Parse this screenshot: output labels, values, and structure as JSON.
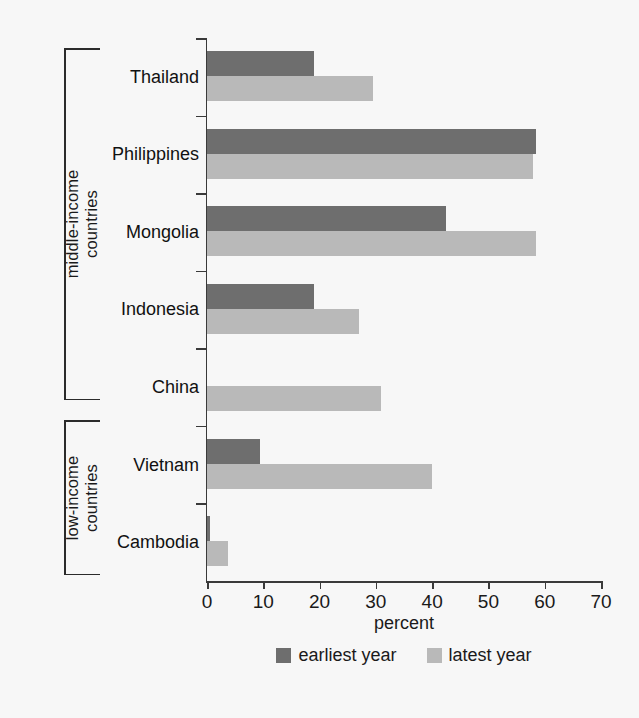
{
  "chart_data": {
    "type": "bar",
    "orientation": "horizontal",
    "title": "",
    "xlabel": "percent",
    "ylabel": "",
    "xlim": [
      0,
      70
    ],
    "xticks": [
      0,
      10,
      20,
      30,
      40,
      50,
      60,
      70
    ],
    "xticklabels": [
      "0",
      "10",
      "20",
      "30",
      "40",
      "50",
      "60",
      "70"
    ],
    "grid": false,
    "legend_position": "bottom-center",
    "categories": [
      "Thailand",
      "Philippines",
      "Mongolia",
      "Indonesia",
      "China",
      "Vietnam",
      "Cambodia"
    ],
    "series": [
      {
        "name": "earliest year",
        "color": "#6e6e6e",
        "values": [
          19,
          58.5,
          42.5,
          19,
          0,
          9.5,
          0.5
        ]
      },
      {
        "name": "latest year",
        "color": "#b9b9b9",
        "values": [
          29.5,
          58,
          58.5,
          27,
          31,
          40,
          3.8
        ]
      }
    ],
    "groups": [
      {
        "label_line1": "middle-income",
        "label_line2": "countries",
        "categories": [
          "Thailand",
          "Philippines",
          "Mongolia",
          "Indonesia",
          "China"
        ]
      },
      {
        "label_line1": "low-income",
        "label_line2": "countries",
        "categories": [
          "Vietnam",
          "Cambodia"
        ]
      }
    ]
  },
  "legend": {
    "items": [
      {
        "label": "earliest year",
        "color": "#6e6e6e"
      },
      {
        "label": "latest year",
        "color": "#b9b9b9"
      }
    ]
  },
  "axis": {
    "x_title": "percent"
  },
  "colors": {
    "earliest": "#6e6e6e",
    "latest": "#b9b9b9",
    "axis": "#3a3a3a",
    "background": "#f7f7f7",
    "text": "#1a1a1a"
  }
}
